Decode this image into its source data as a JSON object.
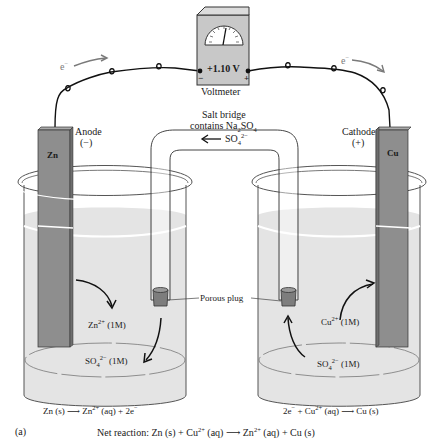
{
  "figure_label": "(a)",
  "voltmeter": {
    "reading": "+1.10 V",
    "label": "Voltmeter",
    "negative_terminal": "−",
    "positive_terminal": "+"
  },
  "electron_flow": {
    "left": {
      "symbol": "e",
      "charge": "−"
    },
    "right": {
      "symbol": "e",
      "charge": "−"
    }
  },
  "salt_bridge": {
    "line1": "Salt bridge",
    "line2_prefix": "contains Na",
    "line2_sub1": "2",
    "line2_mid": "SO",
    "line2_sub2": "4",
    "ion_flow": {
      "arrow": "⟵",
      "ion": "SO",
      "sub": "4",
      "charge": "2−"
    }
  },
  "porous_plug_label": "Porous plug",
  "anode": {
    "title": "Anode",
    "sign": "(−)",
    "electrode": "Zn",
    "ion1": {
      "base": "Zn",
      "charge": "2+",
      "conc": "(1M)"
    },
    "ion2": {
      "base": "SO",
      "sub": "4",
      "charge": "2−",
      "conc": "(1M)"
    },
    "half_reaction": {
      "left": "Zn (s)",
      "arrow": "⟶",
      "right_base": "Zn",
      "right_charge": "2+",
      "right_rest": "(aq) + 2e",
      "electron_charge": "−"
    }
  },
  "cathode": {
    "title": "Cathode",
    "sign": "(+)",
    "electrode": "Cu",
    "ion1": {
      "base": "Cu",
      "charge": "2+",
      "conc": "(1M)"
    },
    "ion2": {
      "base": "SO",
      "sub": "4",
      "charge": "2−",
      "conc": "(1M)"
    },
    "half_reaction": {
      "left_e": "2e",
      "left_e_charge": "−",
      "plus": "+ Cu",
      "cu_charge": "2+",
      "aq": "(aq)",
      "arrow": "⟶",
      "right": "Cu (s)"
    }
  },
  "net_reaction": {
    "prefix": "Net reaction: Zn (s) + Cu",
    "cu_charge": "2+",
    "aq1": "(aq)",
    "arrow": "⟶",
    "zn": "Zn",
    "zn_charge": "2+",
    "rest": "(aq) + Cu (s)"
  },
  "colors": {
    "electrode": "#8e8e8e",
    "electrode_dark": "#6e6e6e",
    "solution": "#e4e4e4",
    "beaker_line": "#555555",
    "voltmeter_body": "#c8c8c8",
    "plug": "#7d7d7d"
  }
}
